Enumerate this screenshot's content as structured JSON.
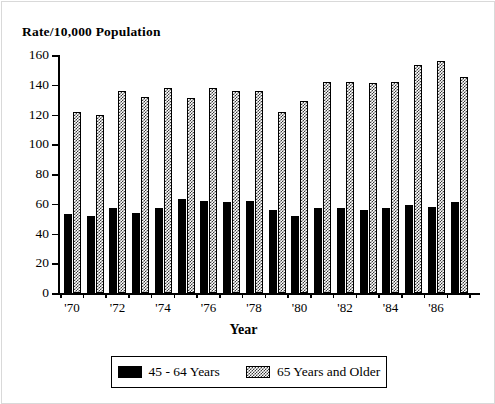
{
  "chart_data": {
    "type": "bar",
    "title": "Rate/10,000 Population",
    "xlabel": "Year",
    "ylabel": "",
    "ylim": [
      0,
      160
    ],
    "yticks": [
      0,
      20,
      40,
      60,
      80,
      100,
      120,
      140,
      160
    ],
    "ytick_labels": [
      "0",
      "20",
      "40",
      "60",
      "80",
      "100",
      "120",
      "140",
      "160"
    ],
    "grid": false,
    "legend_position": "bottom",
    "categories": [
      "1970",
      "1971",
      "1972",
      "1973",
      "1974",
      "1975",
      "1976",
      "1977",
      "1978",
      "1979",
      "1980",
      "1981",
      "1982",
      "1983",
      "1984",
      "1985",
      "1986",
      "1987"
    ],
    "xtick_labels": [
      "'70",
      "",
      "'72",
      "",
      "'74",
      "",
      "'76",
      "",
      "'78",
      "",
      "'80",
      "",
      "'82",
      "",
      "'84",
      "",
      "'86",
      ""
    ],
    "series": [
      {
        "name": "45 - 64 Years",
        "color": "#000000",
        "pattern": "solid",
        "values": [
          53,
          52,
          57,
          54,
          57,
          63,
          62,
          61,
          62,
          56,
          52,
          57,
          57,
          56,
          57,
          59,
          58,
          61
        ]
      },
      {
        "name": "65 Years and Older",
        "color": "#3a3a3a",
        "pattern": "hatched",
        "values": [
          122,
          120,
          136,
          132,
          138,
          131,
          138,
          136,
          136,
          122,
          129,
          142,
          142,
          141,
          142,
          153,
          156,
          145
        ]
      }
    ]
  },
  "legend": {
    "entries": [
      {
        "label": "45 - 64 Years",
        "swatch": "solid-black-swatch"
      },
      {
        "label": "65 Years and Older",
        "swatch": "hatched-swatch"
      }
    ]
  }
}
